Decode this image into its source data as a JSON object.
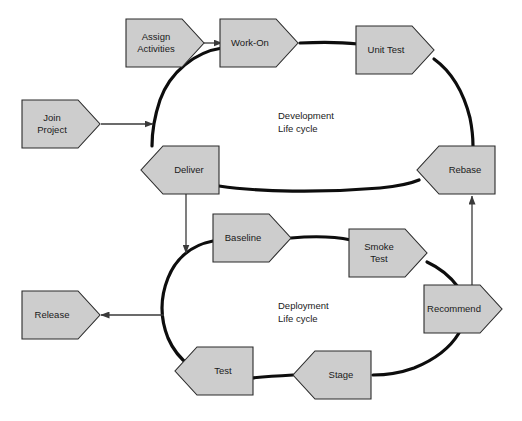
{
  "diagram": {
    "type": "flowchart",
    "background_color": "#ffffff",
    "shape_fill_color": "#cdcdcd",
    "shape_border_color": "#2b2b2b",
    "cycle_stroke_color": "#0d0d0d",
    "connector_color": "#3a3a3a",
    "cycles": [
      {
        "id": "development",
        "label_line1": "Development",
        "label_line2": "Life cycle",
        "center_x": 310,
        "center_y": 123,
        "radius_x": 150,
        "radius_y": 63
      },
      {
        "id": "deployment",
        "label_line1": "Deployment",
        "label_line2": "Life cycle",
        "center_x": 310,
        "center_y": 303,
        "radius_x": 148,
        "radius_y": 65
      }
    ],
    "nodes": [
      {
        "id": "join-project",
        "label_line1": "Join",
        "label_line2": "Project",
        "direction": "right",
        "x": 22,
        "y": 100,
        "width": 78,
        "height": 48,
        "tip": 22
      },
      {
        "id": "assign-activities",
        "label_line1": "Assign",
        "label_line2": "Activities",
        "direction": "right",
        "x": 126,
        "y": 19,
        "width": 78,
        "height": 48,
        "tip": 22
      },
      {
        "id": "work-on",
        "label_line1": "Work-On",
        "label_line2": "",
        "direction": "right",
        "x": 220,
        "y": 19,
        "width": 78,
        "height": 48,
        "tip": 22
      },
      {
        "id": "unit-test",
        "label_line1": "Unit Test",
        "label_line2": "",
        "direction": "right",
        "x": 356,
        "y": 26,
        "width": 78,
        "height": 48,
        "tip": 22
      },
      {
        "id": "rebase",
        "label_line1": "Rebase",
        "label_line2": "",
        "direction": "left",
        "x": 417,
        "y": 146,
        "width": 78,
        "height": 48,
        "tip": 22
      },
      {
        "id": "deliver",
        "label_line1": "Deliver",
        "label_line2": "",
        "direction": "left",
        "x": 141,
        "y": 146,
        "width": 78,
        "height": 48,
        "tip": 22
      },
      {
        "id": "baseline",
        "label_line1": "Baseline",
        "label_line2": "",
        "direction": "right",
        "x": 213,
        "y": 214,
        "width": 78,
        "height": 48,
        "tip": 22
      },
      {
        "id": "smoke-test",
        "label_line1": "Smoke",
        "label_line2": "Test",
        "direction": "right",
        "x": 349,
        "y": 229,
        "width": 78,
        "height": 48,
        "tip": 22
      },
      {
        "id": "recommend",
        "label_line1": "Recommend",
        "label_line2": "",
        "direction": "right",
        "x": 424,
        "y": 285,
        "width": 78,
        "height": 48,
        "tip": 22
      },
      {
        "id": "stage",
        "label_line1": "Stage",
        "label_line2": "",
        "direction": "left",
        "x": 293,
        "y": 351,
        "width": 78,
        "height": 48,
        "tip": 22
      },
      {
        "id": "test",
        "label_line1": "Test",
        "label_line2": "",
        "direction": "left",
        "x": 175,
        "y": 347,
        "width": 78,
        "height": 48,
        "tip": 22
      },
      {
        "id": "release",
        "label_line1": "Release",
        "label_line2": "",
        "direction": "right",
        "x": 22,
        "y": 291,
        "width": 78,
        "height": 48,
        "tip": 22
      }
    ],
    "connectors": [
      {
        "id": "join-to-development",
        "from": "join-project",
        "to": "development-cycle",
        "orientation": "horizontal-right"
      },
      {
        "id": "assign-to-work-on",
        "from": "assign-activities",
        "to": "work-on",
        "orientation": "horizontal-right"
      },
      {
        "id": "deliver-to-deployment",
        "from": "deliver",
        "to": "deployment-cycle",
        "orientation": "vertical-down"
      },
      {
        "id": "recommend-to-rebase",
        "from": "recommend",
        "to": "rebase",
        "orientation": "vertical-up"
      },
      {
        "id": "deployment-to-release",
        "from": "deployment-cycle",
        "to": "release",
        "orientation": "horizontal-left"
      }
    ]
  }
}
